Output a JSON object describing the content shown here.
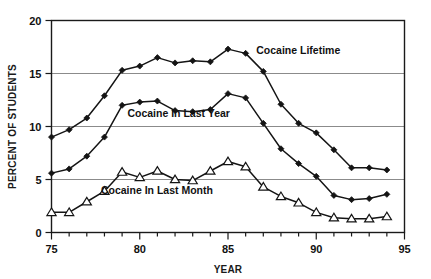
{
  "chart_data": {
    "type": "line",
    "title": "",
    "subtitle": "",
    "xlabel": "YEAR",
    "ylabel": "PERCENT OF STUDENTS",
    "xlim": [
      75,
      95
    ],
    "ylim": [
      0,
      20
    ],
    "grid": true,
    "grid_axis": "y",
    "legend_position": "inline-annotations",
    "x": [
      75,
      76,
      77,
      78,
      79,
      80,
      81,
      82,
      83,
      84,
      85,
      86,
      87,
      88,
      89,
      90,
      91,
      92,
      93,
      94
    ],
    "xticks": [
      75,
      80,
      85,
      90,
      95
    ],
    "xticklabels": [
      "75",
      "80",
      "85",
      "90",
      "95"
    ],
    "xtick_minor_step": 1,
    "yticks": [
      0,
      5,
      10,
      15,
      20
    ],
    "yticklabels": [
      "0",
      "5",
      "10",
      "15",
      "20"
    ],
    "series": [
      {
        "name": "Cocaine Lifetime",
        "marker": "diamond",
        "values": [
          9.0,
          9.7,
          10.8,
          12.9,
          15.3,
          15.7,
          16.5,
          16.0,
          16.2,
          16.1,
          17.3,
          16.9,
          15.2,
          12.1,
          10.3,
          9.4,
          7.8,
          6.1,
          6.1,
          5.9
        ]
      },
      {
        "name": "Cocaine In Last Year",
        "marker": "diamond",
        "values": [
          5.6,
          6.0,
          7.2,
          9.0,
          12.0,
          12.3,
          12.4,
          11.5,
          11.4,
          11.6,
          13.1,
          12.7,
          10.3,
          7.9,
          6.5,
          5.3,
          3.5,
          3.1,
          3.2,
          3.6
        ]
      },
      {
        "name": "Cocaine In Last Month",
        "marker": "triangle",
        "values": [
          1.9,
          1.9,
          2.9,
          3.9,
          5.7,
          5.2,
          5.8,
          5.0,
          4.9,
          5.8,
          6.7,
          6.2,
          4.3,
          3.4,
          2.8,
          1.9,
          1.4,
          1.3,
          1.3,
          1.5
        ]
      }
    ],
    "annotations": [
      {
        "text": "Cocaine Lifetime",
        "x": 86.6,
        "y": 17.25
      },
      {
        "text": "Cocaine In Last Year",
        "x": 79.3,
        "y": 11.25
      },
      {
        "text": "Cocaine In Last Month",
        "x": 77.8,
        "y": 4.0
      }
    ],
    "colors": {
      "line": "#141414",
      "grid": "#8b8b8b",
      "frame": "#1a1a1a",
      "text": "#111111",
      "background": "#ffffff"
    }
  }
}
